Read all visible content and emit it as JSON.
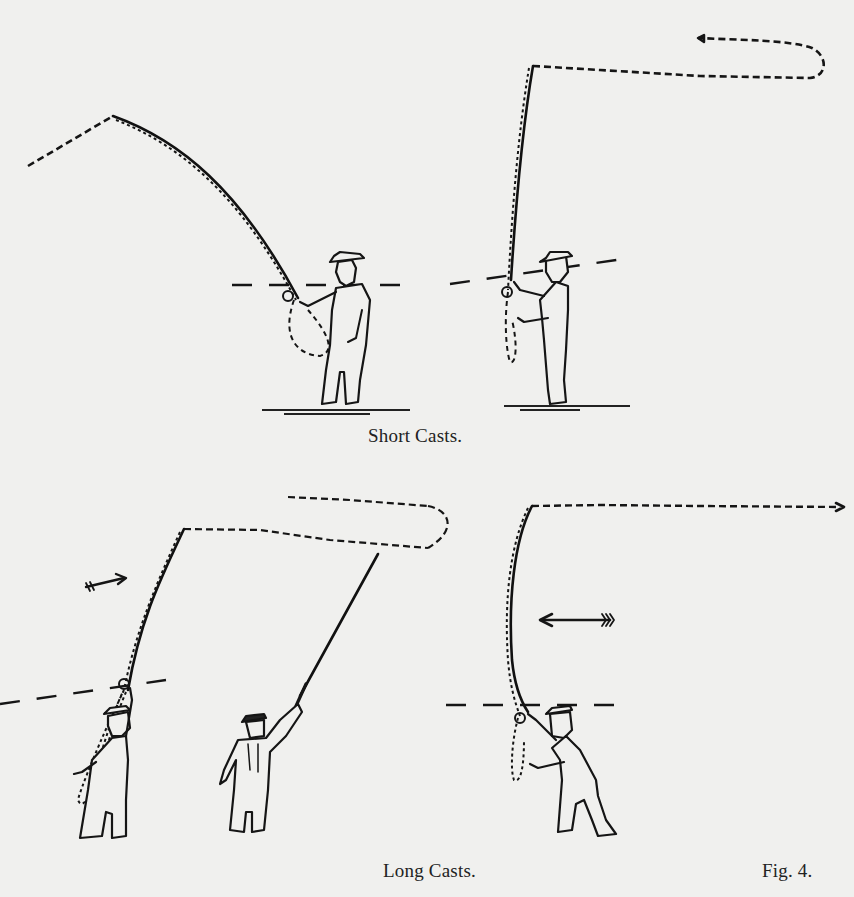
{
  "figure": {
    "label": "Fig. 4."
  },
  "sections": {
    "short_casts": {
      "caption": "Short Casts.",
      "panels": [
        {
          "name": "back-cast",
          "description": "Angler with rod bent back, line flowing behind to the left"
        },
        {
          "name": "forward-cast",
          "description": "Angler with rod upright, line looping forward to the right"
        }
      ]
    },
    "long_casts": {
      "caption": "Long Casts.",
      "panels": [
        {
          "name": "back-cast-front-view",
          "description": "Angler raising rod with line traveling back, arrow pointing right"
        },
        {
          "name": "back-cast-rear-view",
          "description": "Angler seen from behind, rod extended high"
        },
        {
          "name": "forward-cast",
          "description": "Angler leaning forward, line extended straight, arrow pointing left"
        }
      ]
    }
  },
  "icons": {
    "arrow_right": "arrow-right-icon",
    "arrow_left": "arrow-left-icon"
  },
  "colors": {
    "paper": "#f0f0ee",
    "ink": "#151515"
  }
}
